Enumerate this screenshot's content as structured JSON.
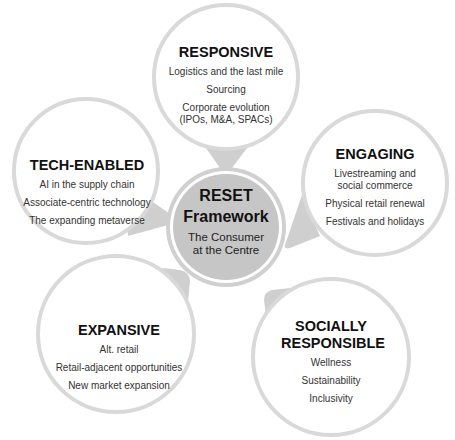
{
  "colors": {
    "bubble_ring": "#d9d9d9",
    "pointer": "#cfcfcf",
    "center_fill": "#c6c6c6",
    "center_ring": "#ffffff",
    "text": "#1a1a1a"
  },
  "center": {
    "title_line1": "RESET",
    "title_line2": "Framework",
    "subtitle": "The Consumer at the Centre"
  },
  "bubbles": [
    {
      "id": "responsive",
      "title": "RESPONSIVE",
      "items": [
        "Logistics and the last mile",
        "Sourcing",
        "Corporate evolution (IPOs, M&A, SPACs)"
      ]
    },
    {
      "id": "tech-enabled",
      "title": "TECH-ENABLED",
      "items": [
        "AI in the supply chain",
        "Associate-centric technology",
        "The expanding metaverse"
      ]
    },
    {
      "id": "engaging",
      "title": "ENGAGING",
      "items": [
        "Livestreaming and social commerce",
        "Physical retail renewal",
        "Festivals and holidays"
      ]
    },
    {
      "id": "expansive",
      "title": "EXPANSIVE",
      "items": [
        "Alt. retail",
        "Retail-adjacent opportunities",
        "New market expansion"
      ]
    },
    {
      "id": "socially-responsible",
      "title": "SOCIALLY RESPONSIBLE",
      "items": [
        "Wellness",
        "Sustainability",
        "Inclusivity"
      ]
    }
  ]
}
